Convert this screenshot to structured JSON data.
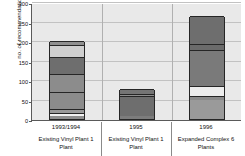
{
  "chart_data": {
    "type": "bar",
    "subtype": "stacked",
    "title": "",
    "xlabel": "",
    "ylabel": "no. of recommendations",
    "ylim": [
      0,
      300
    ],
    "yticks": [
      0,
      50,
      100,
      150,
      200,
      250,
      300
    ],
    "grid": true,
    "legend": "none",
    "categories": [
      "1993/1994",
      "1995",
      "1996"
    ],
    "group_labels": [
      "Existing Vinyl Plant 1 Plant",
      "Existing Vinyl Plant 1 Plant",
      "Expanded Complex 6 Plants"
    ],
    "totals": [
      200,
      78,
      263
    ],
    "bars": [
      {
        "category": "1993/1994",
        "total": 200,
        "segments": [
          {
            "from": 0,
            "to": 8,
            "value": 8,
            "color": "#8f8f8f"
          },
          {
            "from": 8,
            "to": 15,
            "value": 7,
            "color": "#f2f2f2"
          },
          {
            "from": 15,
            "to": 25,
            "value": 10,
            "color": "#9a9a9a"
          },
          {
            "from": 25,
            "to": 70,
            "value": 45,
            "color": "#8c8c8c"
          },
          {
            "from": 70,
            "to": 115,
            "value": 45,
            "color": "#8c8c8c"
          },
          {
            "from": 115,
            "to": 160,
            "value": 45,
            "color": "#6e6e6e"
          },
          {
            "from": 160,
            "to": 190,
            "value": 30,
            "color": "#cfcfcf"
          },
          {
            "from": 190,
            "to": 200,
            "value": 10,
            "color": "#8f8f8f"
          }
        ]
      },
      {
        "category": "1995",
        "total": 78,
        "segments": [
          {
            "from": 0,
            "to": 8,
            "value": 8,
            "color": "#7c7c7c"
          },
          {
            "from": 8,
            "to": 60,
            "value": 52,
            "color": "#6e6e6e"
          },
          {
            "from": 60,
            "to": 65,
            "value": 5,
            "color": "#8f8f8f"
          },
          {
            "from": 65,
            "to": 78,
            "value": 13,
            "color": "#757575"
          }
        ]
      },
      {
        "category": "1996",
        "total": 263,
        "segments": [
          {
            "from": 0,
            "to": 48,
            "value": 48,
            "color": "#9a9a9a"
          },
          {
            "from": 48,
            "to": 60,
            "value": 12,
            "color": "#8a8a8a"
          },
          {
            "from": 60,
            "to": 85,
            "value": 25,
            "color": "#ededed"
          },
          {
            "from": 85,
            "to": 177,
            "value": 92,
            "color": "#7a7a7a"
          },
          {
            "from": 177,
            "to": 192,
            "value": 15,
            "color": "#6b6b6b"
          },
          {
            "from": 192,
            "to": 263,
            "value": 71,
            "color": "#6e6e6e"
          }
        ]
      }
    ]
  }
}
